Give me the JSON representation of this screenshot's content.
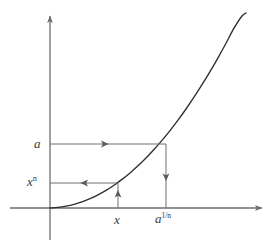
{
  "figure": {
    "title": "",
    "background_color": "#ffffff",
    "axis_color": "#6e6e6e",
    "curve_color": "#2e2e2e",
    "guide_color": "#6e6e6e",
    "label_color": "#3a3a3a"
  },
  "axes": {
    "x_axis_name": "horizontal-axis",
    "y_axis_name": "vertical-axis",
    "origin": {
      "x": 50,
      "y": 208
    },
    "x_axis_start_px": 10,
    "x_axis_end_px": 266,
    "y_axis_top_px": 12,
    "y_axis_bottom_px": 240
  },
  "labels": {
    "y_upper": {
      "base": "a",
      "sup": ""
    },
    "y_lower": {
      "base": "x",
      "sup": "n"
    },
    "x_lower": {
      "base": "x",
      "sup": ""
    },
    "x_upper": {
      "base": "a",
      "sup": "1/n"
    }
  },
  "chart_data": {
    "type": "line",
    "title": "",
    "xlabel": "",
    "ylabel": "",
    "grid": false,
    "legend": null,
    "curve": {
      "name": "y = x^n",
      "equation": "y = x^n",
      "exponent_n": 2,
      "points_px": [
        [
          50,
          208
        ],
        [
          58,
          207.4
        ],
        [
          66,
          206.2
        ],
        [
          74,
          204.4
        ],
        [
          82,
          201.9
        ],
        [
          90,
          198.7
        ],
        [
          98,
          194.9
        ],
        [
          106,
          190.4
        ],
        [
          114,
          185.2
        ],
        [
          122,
          179.4
        ],
        [
          130,
          172.9
        ],
        [
          138,
          165.8
        ],
        [
          146,
          158.0
        ],
        [
          154,
          149.5
        ],
        [
          162,
          140.4
        ],
        [
          170,
          130.6
        ],
        [
          178,
          120.1
        ],
        [
          186,
          109.0
        ],
        [
          194,
          97.2
        ],
        [
          202,
          84.7
        ],
        [
          210,
          71.6
        ],
        [
          218,
          57.8
        ],
        [
          226,
          43.3
        ],
        [
          234,
          28.2
        ],
        [
          242,
          16.0
        ],
        [
          246,
          13.0
        ]
      ]
    },
    "marked_points": [
      {
        "label": "x",
        "x_px": 118,
        "y_px": 183,
        "maps_to": "x^n"
      },
      {
        "label": "a^(1/n)",
        "x_px": 166,
        "y_px": 144,
        "maps_to": "a"
      }
    ],
    "guides": [
      {
        "name": "a-to-curve",
        "orientation": "horizontal",
        "from_px": [
          50,
          144
        ],
        "to_px": [
          166,
          144
        ],
        "arrow_direction": "right",
        "arrow_at_px": [
          107,
          144
        ],
        "from_label": "a",
        "to_label": "a^(1/n)"
      },
      {
        "name": "curve-to-x-axis",
        "orientation": "vertical",
        "from_px": [
          166,
          144
        ],
        "to_px": [
          166,
          208
        ],
        "arrow_direction": "down",
        "arrow_at_px": [
          166,
          179
        ],
        "from_label": "a",
        "to_label": "a^(1/n)"
      },
      {
        "name": "x-to-curve",
        "orientation": "vertical",
        "from_px": [
          118,
          208
        ],
        "to_px": [
          118,
          183
        ],
        "arrow_direction": "up",
        "arrow_at_px": [
          118,
          192
        ],
        "from_label": "x",
        "to_label": "x^n"
      },
      {
        "name": "curve-to-y-axis",
        "orientation": "horizontal",
        "from_px": [
          118,
          183
        ],
        "to_px": [
          50,
          183
        ],
        "arrow_direction": "left",
        "arrow_at_px": [
          82,
          183
        ],
        "from_label": "x",
        "to_label": "x^n"
      }
    ],
    "axis_values": {
      "y_ticks": [
        "x^n",
        "a"
      ],
      "x_ticks": [
        "x",
        "a^(1/n)"
      ]
    }
  }
}
